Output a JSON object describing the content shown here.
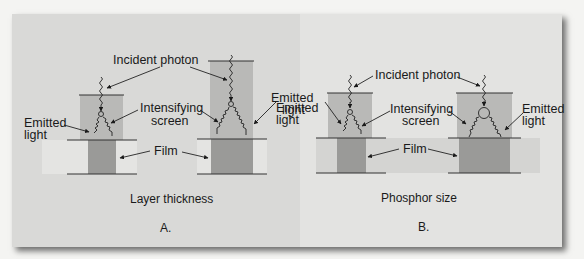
{
  "figure": {
    "panels": [
      {
        "id": "A",
        "caption": "Layer thickness",
        "letter": "A.",
        "labels": {
          "incident_photon": "Incident photon",
          "intensifying_screen_1": "Intensifying",
          "intensifying_screen_2": "screen",
          "emitted_light_left_1": "Emitted",
          "emitted_light_left_2": "light",
          "emitted_light_right_1": "Emitted",
          "emitted_light_right_2": "light",
          "film": "Film"
        }
      },
      {
        "id": "B",
        "caption": "Phosphor size",
        "letter": "B.",
        "labels": {
          "incident_photon": "Incident photon",
          "intensifying_screen_1": "Intensifying",
          "intensifying_screen_2": "screen",
          "emitted_light_left_1": "Emitted",
          "emitted_light_left_2": "light",
          "emitted_light_right_1": "Emitted",
          "emitted_light_right_2": "light",
          "film": "Film"
        }
      }
    ],
    "colors": {
      "background": "#d9d9d7",
      "screen": "#b9b9b7",
      "film_band": "#e4e4e2",
      "film_exposed": "#9a9a98",
      "line": "#333333"
    }
  }
}
